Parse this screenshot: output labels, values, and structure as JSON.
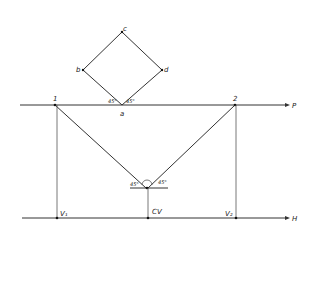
{
  "diagram": {
    "type": "perspective-construction",
    "square_labels": {
      "a": "a",
      "b": "b",
      "c": "c",
      "d": "d"
    },
    "picture_plane_label": "P",
    "horizon_label": "H",
    "point_labels": {
      "p1": "1",
      "p2": "2"
    },
    "vanishing_labels": {
      "v1": "V₁",
      "cv": "CV",
      "v2": "V₂"
    },
    "angle_labels": {
      "top_left": "45°",
      "top_right": "45°",
      "station_left": "45°",
      "station_right": "45°"
    },
    "colors": {
      "line": "#333333",
      "background": "#ffffff"
    }
  }
}
